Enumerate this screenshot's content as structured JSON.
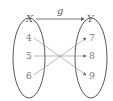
{
  "diagram": {
    "function_label": "g",
    "domain": {
      "label": "X",
      "elements": [
        "4",
        "5",
        "6"
      ]
    },
    "codomain": {
      "label": "Y",
      "elements": [
        "7",
        "8",
        "9"
      ]
    },
    "mappings": [
      {
        "from": "4",
        "to": "9"
      },
      {
        "from": "5",
        "to": "8"
      },
      {
        "from": "6",
        "to": "7"
      }
    ],
    "colors": {
      "ellipse": "#444444",
      "arrow": "#999999",
      "text": "#777777"
    }
  }
}
